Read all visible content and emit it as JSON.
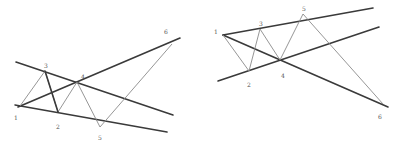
{
  "colors": {
    "background": "#ffffff",
    "trendline": "#3a3a3a",
    "wave": "#8a8a8a",
    "label": "#555555"
  },
  "diagrams": [
    {
      "name": "left-pattern",
      "trendlines": [
        {
          "x1": 16,
          "y1": 62,
          "x2": 173,
          "y2": 115
        },
        {
          "x1": 15,
          "y1": 105,
          "x2": 167,
          "y2": 132
        },
        {
          "x1": 18,
          "y1": 107,
          "x2": 180,
          "y2": 38
        }
      ],
      "wave_points": [
        [
          20,
          106
        ],
        [
          45,
          71
        ],
        [
          58,
          112
        ],
        [
          77,
          82
        ],
        [
          100,
          127
        ],
        [
          172,
          44
        ]
      ],
      "cross_lines": [
        {
          "x1": 45,
          "y1": 71,
          "x2": 58,
          "y2": 112
        }
      ],
      "labels": [
        {
          "text": "1",
          "x": 14,
          "y": 120
        },
        {
          "text": "2",
          "x": 56,
          "y": 129
        },
        {
          "text": "3",
          "x": 44,
          "y": 68
        },
        {
          "text": "4",
          "x": 81,
          "y": 79
        },
        {
          "text": "5",
          "x": 98,
          "y": 140
        },
        {
          "text": "6",
          "x": 164,
          "y": 34
        }
      ]
    },
    {
      "name": "right-pattern",
      "trendlines": [
        {
          "x1": 223,
          "y1": 35,
          "x2": 373,
          "y2": 8
        },
        {
          "x1": 218,
          "y1": 81,
          "x2": 379,
          "y2": 27
        },
        {
          "x1": 223,
          "y1": 35,
          "x2": 388,
          "y2": 107
        }
      ],
      "wave_points": [
        [
          223,
          35
        ],
        [
          249,
          71
        ],
        [
          260,
          29
        ],
        [
          280,
          60
        ],
        [
          303,
          14
        ],
        [
          383,
          104
        ]
      ],
      "cross_lines": [],
      "labels": [
        {
          "text": "1",
          "x": 214,
          "y": 34
        },
        {
          "text": "2",
          "x": 247,
          "y": 87
        },
        {
          "text": "3",
          "x": 259,
          "y": 26
        },
        {
          "text": "4",
          "x": 281,
          "y": 78
        },
        {
          "text": "5",
          "x": 302,
          "y": 11
        },
        {
          "text": "6",
          "x": 378,
          "y": 119
        }
      ]
    }
  ]
}
